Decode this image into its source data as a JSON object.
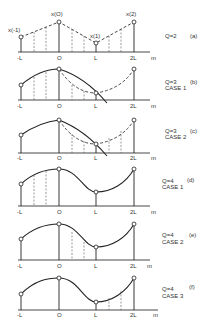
{
  "figure": {
    "axis_ticks": [
      "-L",
      "O",
      "L",
      "2L"
    ],
    "axis_unit": "m",
    "node_labels": [
      "x(-1)",
      "x(O)",
      "x(1)",
      "x(2)"
    ],
    "panels": [
      {
        "id": "a",
        "tag": "(a)",
        "q": "Q=2",
        "case": ""
      },
      {
        "id": "b",
        "tag": "(b)",
        "q": "Q=3",
        "case": "CASE 1"
      },
      {
        "id": "c",
        "tag": "(c)",
        "q": "Q=3",
        "case": "CASE 2"
      },
      {
        "id": "d",
        "tag": "(d)",
        "q": "Q=4",
        "case": "CASE 1"
      },
      {
        "id": "e",
        "tag": "(e)",
        "q": "Q=4",
        "case": "CASE 2"
      },
      {
        "id": "f",
        "tag": "(f)",
        "q": "Q=4",
        "case": "CASE 3"
      }
    ]
  }
}
